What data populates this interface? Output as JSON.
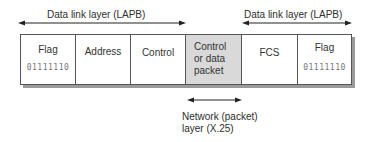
{
  "top_labels": {
    "left": "Data link layer (LAPB)",
    "right": "Data link layer (LAPB)"
  },
  "frame": {
    "cells": [
      {
        "label": "Flag",
        "bits": "01111110"
      },
      {
        "label": "Address"
      },
      {
        "label": "Control"
      },
      {
        "label_lines": [
          "Control",
          "or data",
          "packet"
        ],
        "highlight": true
      },
      {
        "label": "FCS"
      },
      {
        "label": "Flag",
        "bits": "01111110"
      }
    ]
  },
  "bottom_label": {
    "line1": "Network (packet)",
    "line2": "layer (X.25)"
  },
  "colors": {
    "highlight_cell": "#d9d9d9",
    "shadow": "#9a9a9a",
    "border": "#555555"
  }
}
